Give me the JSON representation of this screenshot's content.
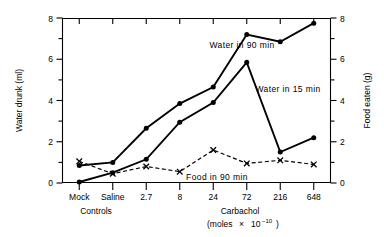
{
  "chart_data": {
    "type": "line",
    "title": "",
    "categories": [
      "Mock",
      "Saline",
      "2.7",
      "8",
      "24",
      "72",
      "216",
      "648"
    ],
    "series": [
      {
        "name": "Water in 90 min",
        "axis": "left",
        "marker": "filled-circle",
        "line": "solid",
        "values": [
          0.85,
          1.0,
          2.65,
          3.85,
          4.65,
          7.2,
          6.85,
          7.75
        ]
      },
      {
        "name": "Water in 15 min",
        "axis": "left",
        "marker": "filled-circle",
        "line": "solid",
        "values": [
          0.05,
          0.5,
          1.15,
          2.95,
          3.9,
          5.85,
          1.5,
          2.2
        ]
      },
      {
        "name": "Food in 90 min",
        "axis": "right",
        "marker": "cross",
        "line": "dashed",
        "values": [
          1.05,
          0.45,
          0.8,
          0.55,
          1.6,
          0.95,
          1.1,
          0.9
        ]
      }
    ],
    "ylabel": "Water drunk (ml)",
    "ylabel_right": "Food eaten (g)",
    "ylim": [
      0,
      8
    ],
    "ylim_right": [
      0,
      8
    ],
    "yticks": [
      0,
      2,
      4,
      6,
      8
    ],
    "yticks_right": [
      0,
      2,
      4,
      6,
      8
    ],
    "yminorticks": [
      1,
      3,
      5,
      7
    ],
    "yminorticks_right": [
      1,
      3,
      5,
      7
    ],
    "xlabel": "",
    "grid": false,
    "legend": "inline-annotations",
    "group_labels": [
      {
        "text": "Controls",
        "categories": [
          "Mock",
          "Saline"
        ]
      },
      {
        "text": "Carbachol",
        "categories": [
          "2.7",
          "8",
          "24",
          "72",
          "216",
          "648"
        ]
      }
    ],
    "x_units_line1": "Carbachol",
    "x_units_line2_prefix": "(moles",
    "x_units_line2_times": "×",
    "x_units_line2_base": "10",
    "x_units_line2_exp": "−10",
    "x_units_line2_suffix": ")"
  },
  "labels": {
    "y_left": "Water drunk (ml)",
    "y_right": "Food eaten (g)",
    "series_water90": "Water in 90 min",
    "series_water15": "Water in 15 min",
    "series_food90": "Food in 90 min",
    "group_controls": "Controls",
    "group_carbachol": "Carbachol",
    "units_prefix": "(moles",
    "units_times": "×",
    "units_base": "10",
    "units_exp": "−10",
    "units_suffix": ")"
  },
  "colors": {
    "line": "#000000",
    "background": "#ffffff"
  }
}
